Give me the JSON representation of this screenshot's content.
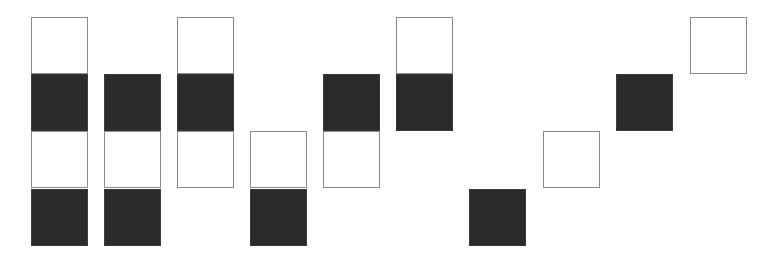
{
  "diagram": {
    "type": "block-pattern",
    "columns": 10,
    "rows": 4,
    "colors": {
      "filled": "#2a2a2a",
      "empty_fill": "#ffffff",
      "empty_border": "#8a8a8a",
      "background": "#ffffff"
    },
    "layout": {
      "col_x": [
        31,
        104,
        177,
        250,
        323,
        396,
        469,
        543,
        616,
        690
      ],
      "row_y": [
        17,
        74,
        131,
        189
      ],
      "cell_size": 57
    },
    "grid": [
      [
        "white",
        "black",
        "white",
        "black"
      ],
      [
        null,
        "black",
        "white",
        "black"
      ],
      [
        "white",
        "black",
        "white",
        null
      ],
      [
        null,
        null,
        "white",
        "black"
      ],
      [
        null,
        "black",
        "white",
        null
      ],
      [
        "white",
        "black",
        null,
        null
      ],
      [
        null,
        null,
        null,
        "black"
      ],
      [
        null,
        null,
        "white",
        null
      ],
      [
        null,
        "black",
        null,
        null
      ],
      [
        "white",
        null,
        null,
        null
      ]
    ]
  }
}
